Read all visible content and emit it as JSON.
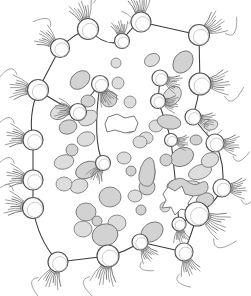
{
  "figure": {
    "title": "Cell schematic with ciliated boundary cells and cytoplasmic granules",
    "type": "line-art-diagram",
    "width": 251,
    "height": 296,
    "background_color": "#ffffff"
  },
  "style": {
    "outline_color": "#3a3a3a",
    "cell_fill": "#fdfdfd",
    "cell_stroke": "#555555",
    "tuft_color": "#8a8a8a",
    "granule_fill": "#d2d2d2",
    "granule_stroke": "#6f6f6f",
    "granule_light_fill": "#dddddd",
    "vacuole_fill": "#ffffff",
    "vacuole_stroke": "#6a6a6a"
  },
  "counts": {
    "boundary_cells": 24,
    "granules": 46,
    "vacuoles": 2
  },
  "boundary_outline": {
    "points": "88,26 141,18 197,33 213,72 215,115 218,155 212,196 195,240 176,272 116,265 57,272 35,231 31,179 29,133 38,91 62,47",
    "stroke_width": 1.05
  },
  "boundary_cells": [
    {
      "id": "cell-01",
      "cx": 88,
      "cy": 29,
      "r": 10.5,
      "tuft_angle": -110,
      "tendril": true
    },
    {
      "id": "cell-02",
      "cx": 141,
      "cy": 22,
      "r": 10.0,
      "tuft_angle": -95,
      "tendril": true
    },
    {
      "id": "cell-03",
      "cx": 60,
      "cy": 48,
      "r": 9.5,
      "tuft_angle": -145,
      "tendril": true
    },
    {
      "id": "cell-04",
      "cx": 122,
      "cy": 41,
      "r": 7.5,
      "tuft_angle": -100,
      "tendril": true
    },
    {
      "id": "cell-05",
      "cx": 199,
      "cy": 35,
      "r": 10.5,
      "tuft_angle": -35,
      "tendril": true
    },
    {
      "id": "cell-06",
      "cx": 38,
      "cy": 90,
      "r": 10.5,
      "tuft_angle": 185,
      "tendril": true
    },
    {
      "id": "cell-07",
      "cx": 200,
      "cy": 84,
      "r": 11.0,
      "tuft_angle": -5,
      "tendril": true
    },
    {
      "id": "cell-08",
      "cx": 78,
      "cy": 112,
      "r": 8.5,
      "tuft_angle": 190,
      "tendril": false
    },
    {
      "id": "cell-09",
      "cx": 100,
      "cy": 84,
      "r": 8.5,
      "tuft_angle": 60,
      "tendril": false
    },
    {
      "id": "cell-10",
      "cx": 160,
      "cy": 78,
      "r": 8.0,
      "tuft_angle": 20,
      "tendril": false
    },
    {
      "id": "cell-11",
      "cx": 158,
      "cy": 101,
      "r": 7.5,
      "tuft_angle": 10,
      "tendril": false
    },
    {
      "id": "cell-12",
      "cx": 33,
      "cy": 140,
      "r": 10.0,
      "tuft_angle": 190,
      "tendril": true
    },
    {
      "id": "cell-13",
      "cx": 193,
      "cy": 117,
      "r": 8.0,
      "tuft_angle": 15,
      "tendril": true
    },
    {
      "id": "cell-14",
      "cx": 215,
      "cy": 143,
      "r": 9.0,
      "tuft_angle": 5,
      "tendril": true
    },
    {
      "id": "cell-15",
      "cx": 171,
      "cy": 140,
      "r": 6.5,
      "tuft_angle": 10,
      "tendril": false
    },
    {
      "id": "cell-16",
      "cx": 33,
      "cy": 180,
      "r": 10.0,
      "tuft_angle": 190,
      "tendril": true
    },
    {
      "id": "cell-17",
      "cx": 103,
      "cy": 163,
      "r": 7.5,
      "tuft_angle": 120,
      "tendril": false
    },
    {
      "id": "cell-18",
      "cx": 33,
      "cy": 208,
      "r": 10.5,
      "tuft_angle": 190,
      "tendril": true
    },
    {
      "id": "cell-19",
      "cx": 222,
      "cy": 188,
      "r": 9.0,
      "tuft_angle": 0,
      "tendril": true
    },
    {
      "id": "cell-20",
      "cx": 197,
      "cy": 214,
      "r": 12.0,
      "tuft_angle": 25,
      "tendril": true
    },
    {
      "id": "cell-21",
      "cx": 179,
      "cy": 224,
      "r": 7.0,
      "tuft_angle": 80,
      "tendril": false
    },
    {
      "id": "cell-22",
      "cx": 58,
      "cy": 262,
      "r": 10.0,
      "tuft_angle": 110,
      "tendril": true
    },
    {
      "id": "cell-23",
      "cx": 108,
      "cy": 256,
      "r": 11.0,
      "tuft_angle": 100,
      "tendril": true
    },
    {
      "id": "cell-24",
      "cx": 140,
      "cy": 242,
      "r": 8.0,
      "tuft_angle": 55,
      "tendril": true
    },
    {
      "id": "cell-25",
      "cx": 184,
      "cy": 252,
      "r": 9.0,
      "tuft_angle": 70,
      "tendril": true
    }
  ],
  "granules": [
    {
      "cx": 80,
      "cy": 80,
      "rx": 11,
      "ry": 8,
      "rot": -40,
      "tone": "mid"
    },
    {
      "cx": 118,
      "cy": 83,
      "rx": 6,
      "ry": 6,
      "rot": 0,
      "tone": "light"
    },
    {
      "cx": 88,
      "cy": 101,
      "rx": 7,
      "ry": 6,
      "rot": 0,
      "tone": "mid"
    },
    {
      "cx": 130,
      "cy": 102,
      "rx": 6,
      "ry": 6,
      "rot": 0,
      "tone": "light"
    },
    {
      "cx": 109,
      "cy": 99,
      "rx": 8,
      "ry": 8,
      "rot": 0,
      "tone": "mid"
    },
    {
      "cx": 88,
      "cy": 118,
      "rx": 10,
      "ry": 7,
      "rot": -30,
      "tone": "light"
    },
    {
      "cx": 183,
      "cy": 62,
      "rx": 12,
      "ry": 9,
      "rot": -55,
      "tone": "mid"
    },
    {
      "cx": 172,
      "cy": 96,
      "rx": 11,
      "ry": 8,
      "rot": -50,
      "tone": "light"
    },
    {
      "cx": 156,
      "cy": 126,
      "rx": 7,
      "ry": 6,
      "rot": 0,
      "tone": "light"
    },
    {
      "cx": 169,
      "cy": 122,
      "rx": 12,
      "ry": 7,
      "rot": 10,
      "tone": "mid"
    },
    {
      "cx": 146,
      "cy": 138,
      "rx": 7,
      "ry": 6,
      "rot": 0,
      "tone": "light"
    },
    {
      "cx": 182,
      "cy": 157,
      "rx": 12,
      "ry": 9,
      "rot": -25,
      "tone": "mid"
    },
    {
      "cx": 200,
      "cy": 172,
      "rx": 12,
      "ry": 7,
      "rot": -20,
      "tone": "light"
    },
    {
      "cx": 148,
      "cy": 174,
      "rx": 7,
      "ry": 14,
      "rot": 5,
      "tone": "mid"
    },
    {
      "cx": 147,
      "cy": 187,
      "rx": 8,
      "ry": 8,
      "rot": 0,
      "tone": "mid"
    },
    {
      "cx": 188,
      "cy": 188,
      "rx": 14,
      "ry": 7,
      "rot": -8,
      "tone": "light"
    },
    {
      "cx": 175,
      "cy": 186,
      "rx": 8,
      "ry": 6,
      "rot": -10,
      "tone": "mid"
    },
    {
      "cx": 124,
      "cy": 158,
      "rx": 7,
      "ry": 6,
      "rot": 0,
      "tone": "light"
    },
    {
      "cx": 140,
      "cy": 142,
      "rx": 7,
      "ry": 6,
      "rot": 0,
      "tone": "light"
    },
    {
      "cx": 131,
      "cy": 171,
      "rx": 5,
      "ry": 5,
      "rot": 0,
      "tone": "mid"
    },
    {
      "cx": 87,
      "cy": 170,
      "rx": 12,
      "ry": 8,
      "rot": -25,
      "tone": "mid"
    },
    {
      "cx": 79,
      "cy": 186,
      "rx": 9,
      "ry": 7,
      "rot": -20,
      "tone": "light"
    },
    {
      "cx": 110,
      "cy": 197,
      "rx": 11,
      "ry": 10,
      "rot": 0,
      "tone": "mid"
    },
    {
      "cx": 135,
      "cy": 196,
      "rx": 7,
      "ry": 6,
      "rot": 0,
      "tone": "light"
    },
    {
      "cx": 86,
      "cy": 212,
      "rx": 10,
      "ry": 9,
      "rot": 0,
      "tone": "mid"
    },
    {
      "cx": 117,
      "cy": 223,
      "rx": 9,
      "ry": 8,
      "rot": 0,
      "tone": "light"
    },
    {
      "cx": 97,
      "cy": 221,
      "rx": 5,
      "ry": 5,
      "rot": 0,
      "tone": "mid"
    },
    {
      "cx": 83,
      "cy": 229,
      "rx": 9,
      "ry": 8,
      "rot": 0,
      "tone": "light"
    },
    {
      "cx": 105,
      "cy": 235,
      "rx": 13,
      "ry": 11,
      "rot": -15,
      "tone": "mid"
    },
    {
      "cx": 152,
      "cy": 232,
      "rx": 12,
      "ry": 9,
      "rot": -35,
      "tone": "mid"
    },
    {
      "cx": 64,
      "cy": 184,
      "rx": 8,
      "ry": 7,
      "rot": 0,
      "tone": "light"
    },
    {
      "cx": 72,
      "cy": 150,
      "rx": 6,
      "ry": 6,
      "rot": 0,
      "tone": "mid"
    },
    {
      "cx": 86,
      "cy": 139,
      "rx": 9,
      "ry": 7,
      "rot": -20,
      "tone": "light"
    },
    {
      "cx": 68,
      "cy": 127,
      "rx": 9,
      "ry": 7,
      "rot": -15,
      "tone": "mid"
    },
    {
      "cx": 60,
      "cy": 112,
      "rx": 10,
      "ry": 7,
      "rot": -25,
      "tone": "light"
    },
    {
      "cx": 205,
      "cy": 200,
      "rx": 9,
      "ry": 7,
      "rot": -20,
      "tone": "mid"
    },
    {
      "cx": 210,
      "cy": 160,
      "rx": 9,
      "ry": 7,
      "rot": -25,
      "tone": "light"
    },
    {
      "cx": 166,
      "cy": 160,
      "rx": 6,
      "ry": 6,
      "rot": 0,
      "tone": "mid"
    },
    {
      "cx": 129,
      "cy": 127,
      "rx": 6,
      "ry": 6,
      "rot": 0,
      "tone": "light"
    },
    {
      "cx": 116,
      "cy": 63,
      "rx": 5,
      "ry": 5,
      "rot": 0,
      "tone": "light"
    },
    {
      "cx": 196,
      "cy": 140,
      "rx": 6,
      "ry": 5,
      "rot": 0,
      "tone": "mid"
    },
    {
      "cx": 165,
      "cy": 207,
      "rx": 5,
      "ry": 5,
      "rot": 0,
      "tone": "light"
    },
    {
      "cx": 64,
      "cy": 162,
      "rx": 10,
      "ry": 7,
      "rot": -15,
      "tone": "light"
    },
    {
      "cx": 211,
      "cy": 125,
      "rx": 7,
      "ry": 5,
      "rot": -15,
      "tone": "light"
    },
    {
      "cx": 152,
      "cy": 60,
      "rx": 8,
      "ry": 6,
      "rot": -30,
      "tone": "light"
    },
    {
      "cx": 141,
      "cy": 210,
      "rx": 5,
      "ry": 5,
      "rot": 0,
      "tone": "mid"
    }
  ],
  "peanuts": [
    {
      "path": "M145,160 q7,-6 9,3 q2,9 0,16 q-2,9 -9,7 q-7,-2 -6,-11 q1,-9 6,-15 Z"
    },
    {
      "path": "M170,182 q10,-7 17,-1 q7,6 13,2 q7,-4 8,3 q1,7 -8,9 q-9,2 -17,1 q-9,-1 -13,-4 q-5,-4 0,-10 Z"
    }
  ],
  "vacuoles": [
    {
      "id": "vacuole-upper",
      "path": "M108,117 l9,-3 l8,4 l9,-2 l4,7 l-3,8 l-10,2 l-10,-3 l-8,2 l-2,-8 Z"
    },
    {
      "id": "vacuole-lower",
      "path": "M163,194 l5,-7 l7,4 l7,-5 l3,8 l8,2 l-5,7 l2,8 l-9,-2 l-6,6 l-4,-8 l-9,1 l4,-8 Z"
    }
  ]
}
